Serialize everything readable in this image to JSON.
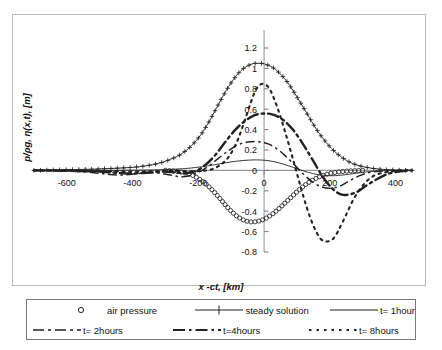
{
  "chart_data": {
    "type": "line",
    "title": "",
    "xlabel": "x -ct,  [km]",
    "ylabel": "p/ρg,  η(x,t),  [m]",
    "xlim": [
      -700,
      450
    ],
    "ylim": [
      -0.8,
      1.2
    ],
    "xticks": [
      -600,
      -400,
      -200,
      0,
      200,
      400
    ],
    "xtick_labels": [
      "-600",
      "-400",
      "-200",
      "0",
      "200",
      "400"
    ],
    "yticks": [
      1.2,
      1.0,
      0.8,
      0.6,
      0.4,
      0.2,
      0,
      -0.2,
      -0.4,
      -0.6,
      -0.8
    ],
    "ytick_labels": [
      "1.2",
      "1",
      "0.8",
      "0.6",
      "0.4",
      "0.2",
      "0",
      "-0.2",
      "-0.4",
      "-0.6",
      "-0.8"
    ],
    "grid": false,
    "legend_position": "bottom",
    "yaxis_position": "center-at-x-0",
    "series": [
      {
        "name": "air pressure",
        "style": "markers-circle",
        "marker": "open-circle",
        "x": [
          -300,
          -280,
          -260,
          -240,
          -220,
          -200,
          -180,
          -160,
          -140,
          -120,
          -100,
          -80,
          -60,
          -40,
          -20,
          0,
          20,
          40,
          60,
          80,
          100,
          120,
          140,
          160,
          180,
          200,
          220,
          240,
          260,
          280,
          300
        ],
        "y": [
          0,
          -0.005,
          -0.012,
          -0.025,
          -0.045,
          -0.08,
          -0.125,
          -0.185,
          -0.255,
          -0.33,
          -0.4,
          -0.455,
          -0.49,
          -0.505,
          -0.5,
          -0.478,
          -0.44,
          -0.39,
          -0.33,
          -0.27,
          -0.21,
          -0.155,
          -0.11,
          -0.075,
          -0.048,
          -0.03,
          -0.018,
          -0.01,
          -0.005,
          -0.002,
          0
        ]
      },
      {
        "name": "steady solution",
        "style": "solid-with-plus-markers",
        "marker": "plus",
        "x": [
          -700,
          -640,
          -580,
          -520,
          -460,
          -400,
          -360,
          -320,
          -280,
          -250,
          -220,
          -190,
          -160,
          -130,
          -100,
          -70,
          -40,
          -20,
          0,
          20,
          40,
          70,
          100,
          130,
          160,
          190,
          220,
          250,
          280,
          320,
          360,
          400,
          450
        ],
        "y": [
          0,
          0.005,
          0.008,
          0.012,
          0.02,
          0.03,
          0.045,
          0.07,
          0.115,
          0.165,
          0.245,
          0.36,
          0.52,
          0.7,
          0.86,
          0.98,
          1.04,
          1.05,
          1.045,
          1.02,
          0.975,
          0.87,
          0.72,
          0.56,
          0.4,
          0.27,
          0.17,
          0.1,
          0.055,
          0.025,
          0.01,
          0.004,
          0
        ]
      },
      {
        "name": "t= 1hour",
        "style": "thin-solid",
        "x": [
          -700,
          -500,
          -400,
          -320,
          -260,
          -220,
          -180,
          -150,
          -120,
          -90,
          -60,
          -30,
          0,
          30,
          60,
          90,
          120,
          150,
          180,
          210,
          240,
          280,
          320,
          380,
          450
        ],
        "y": [
          0,
          0,
          0.002,
          0.006,
          0.014,
          0.024,
          0.04,
          0.056,
          0.073,
          0.088,
          0.098,
          0.103,
          0.1,
          0.086,
          0.06,
          0.028,
          -0.005,
          -0.032,
          -0.048,
          -0.052,
          -0.045,
          -0.028,
          -0.012,
          -0.002,
          0
        ]
      },
      {
        "name": "t= 2hours",
        "style": "dash-dot",
        "x": [
          -700,
          -620,
          -560,
          -500,
          -470,
          -440,
          -410,
          -380,
          -350,
          -320,
          -290,
          -260,
          -230,
          -200,
          -170,
          -140,
          -110,
          -80,
          -50,
          -20,
          0,
          20,
          50,
          80,
          110,
          140,
          170,
          200,
          230,
          260,
          300,
          350,
          450
        ],
        "y": [
          0,
          -0.005,
          -0.012,
          -0.028,
          -0.04,
          -0.045,
          -0.04,
          -0.03,
          -0.022,
          -0.026,
          -0.042,
          -0.06,
          -0.055,
          -0.02,
          0.04,
          0.115,
          0.19,
          0.25,
          0.278,
          0.282,
          0.272,
          0.25,
          0.185,
          0.095,
          -0.005,
          -0.095,
          -0.155,
          -0.175,
          -0.155,
          -0.1,
          -0.04,
          -0.008,
          0
        ]
      },
      {
        "name": "t=4hours",
        "style": "thick-dash-dot",
        "x": [
          -700,
          -600,
          -520,
          -460,
          -420,
          -380,
          -340,
          -300,
          -270,
          -240,
          -210,
          -180,
          -150,
          -120,
          -90,
          -60,
          -30,
          0,
          30,
          60,
          90,
          120,
          150,
          180,
          210,
          240,
          280,
          320,
          380,
          450
        ],
        "y": [
          0,
          -0.004,
          -0.01,
          -0.02,
          -0.03,
          -0.028,
          -0.018,
          -0.012,
          -0.02,
          -0.028,
          -0.01,
          0.05,
          0.145,
          0.27,
          0.39,
          0.48,
          0.54,
          0.558,
          0.545,
          0.49,
          0.39,
          0.25,
          0.09,
          -0.07,
          -0.185,
          -0.24,
          -0.215,
          -0.13,
          -0.03,
          0
        ]
      },
      {
        "name": "t= 8hours",
        "style": "dotted",
        "x": [
          -700,
          -560,
          -460,
          -400,
          -350,
          -310,
          -280,
          -250,
          -220,
          -190,
          -160,
          -130,
          -105,
          -80,
          -60,
          -40,
          -25,
          -10,
          5,
          20,
          40,
          60,
          80,
          100,
          120,
          140,
          160,
          180,
          210,
          240,
          280,
          330,
          400,
          450
        ],
        "y": [
          0,
          -0.003,
          -0.008,
          -0.012,
          -0.01,
          -0.006,
          -0.004,
          -0.006,
          -0.008,
          -0.004,
          0.01,
          0.06,
          0.145,
          0.3,
          0.48,
          0.67,
          0.79,
          0.845,
          0.84,
          0.78,
          0.62,
          0.42,
          0.2,
          -0.03,
          -0.26,
          -0.46,
          -0.61,
          -0.69,
          -0.67,
          -0.5,
          -0.24,
          -0.06,
          -0.004,
          0
        ]
      }
    ]
  },
  "legend": {
    "rows": [
      [
        {
          "label": "air pressure",
          "key": "marker-circle"
        },
        {
          "label": "steady solution",
          "key": "line-plus"
        },
        {
          "label": "t= 1hour",
          "key": "line-solid"
        }
      ],
      [
        {
          "label": "t= 2hours",
          "key": "line-dashdot"
        },
        {
          "label": "t=4hours",
          "key": "line-thick-dashdot"
        },
        {
          "label": "t= 8hours",
          "key": "line-dotted"
        }
      ]
    ]
  }
}
